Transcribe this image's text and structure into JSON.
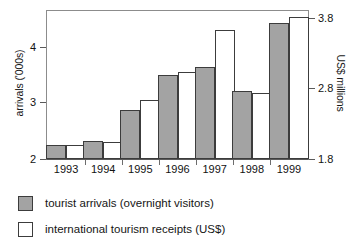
{
  "chart_data": {
    "type": "bar",
    "title": "",
    "subtitle": "",
    "xlabel": "",
    "ylabel": "arrivals ('000s)",
    "y2label": "US$ millions",
    "categories": [
      "1993",
      "1994",
      "1995",
      "1996",
      "1997",
      "1998",
      "1999"
    ],
    "series": [
      {
        "name": "tourist arrivals (overnight visitors)",
        "axis": "left",
        "units": "'000s",
        "color": "#a3a3a3",
        "values": [
          2.25,
          2.33,
          2.9,
          3.55,
          3.7,
          3.25,
          4.5
        ]
      },
      {
        "name": "international tourism receipts (US$)",
        "axis": "right",
        "units": "US$ millions",
        "color": "#ffffff",
        "values": [
          2.0,
          2.05,
          2.65,
          3.05,
          3.65,
          2.75,
          3.85
        ]
      }
    ],
    "ylim": [
      2,
      4.73
    ],
    "y2lim": [
      1.8,
      3.93
    ],
    "yticks": [
      "2",
      "3",
      "4"
    ],
    "ytick_values": [
      2,
      3,
      4
    ],
    "y2ticks": [
      "1.8",
      "2.8",
      "3.8"
    ],
    "y2tick_values": [
      1.8,
      2.8,
      3.8
    ],
    "grid": false,
    "legend_position": "below"
  },
  "axes": {
    "left_title": "arrivals ('000s)",
    "right_title": "US$ millions",
    "left_ticks": [
      "2",
      "3",
      "4"
    ],
    "right_ticks": [
      "1.8",
      "2.8",
      "3.8"
    ],
    "x_labels": [
      "1993",
      "1994",
      "1995",
      "1996",
      "1997",
      "1998",
      "1999"
    ]
  },
  "legend": {
    "items": [
      {
        "label": "tourist arrivals (overnight visitors)",
        "swatch": "grey"
      },
      {
        "label": "international tourism receipts (US$)",
        "swatch": "white"
      }
    ]
  }
}
